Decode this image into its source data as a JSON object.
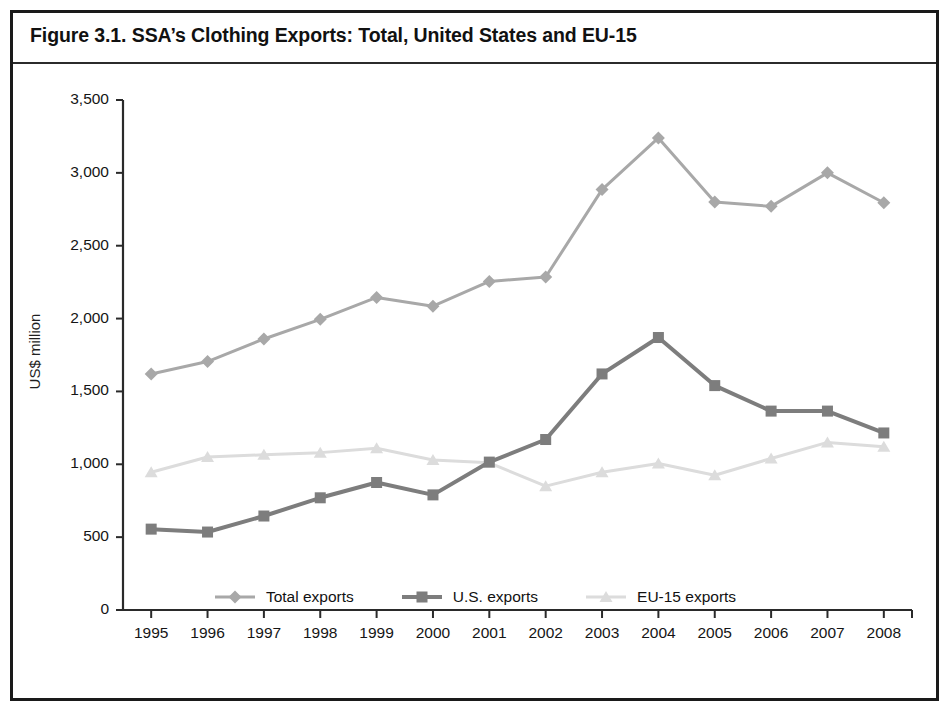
{
  "figure": {
    "title": "Figure 3.1. SSA’s Clothing Exports: Total, United States and EU-15"
  },
  "chart_data": {
    "type": "line",
    "title": "Figure 3.1. SSA’s Clothing Exports: Total, United States and EU-15",
    "xlabel": "",
    "ylabel": "US$ million",
    "categories": [
      "1995",
      "1996",
      "1997",
      "1998",
      "1999",
      "2000",
      "2001",
      "2002",
      "2003",
      "2004",
      "2005",
      "2006",
      "2007",
      "2008"
    ],
    "x": [
      1995,
      1996,
      1997,
      1998,
      1999,
      2000,
      2001,
      2002,
      2003,
      2004,
      2005,
      2006,
      2007,
      2008
    ],
    "ylim": [
      0,
      3500
    ],
    "ytick_labels": [
      "0",
      "500",
      "1,000",
      "1,500",
      "2,000",
      "2,500",
      "3,000",
      "3,500"
    ],
    "yticks": [
      0,
      500,
      1000,
      1500,
      2000,
      2500,
      3000,
      3500
    ],
    "grid": false,
    "legend_position": "bottom",
    "series": [
      {
        "name": "Total exports",
        "color": "#a8a8a8",
        "marker": "diamond",
        "values": [
          1620,
          1705,
          1860,
          1995,
          2145,
          2085,
          2255,
          2285,
          2885,
          3240,
          2800,
          2770,
          3000,
          2795
        ]
      },
      {
        "name": "U.S. exports",
        "color": "#7d7d7d",
        "marker": "square",
        "values": [
          555,
          535,
          645,
          770,
          875,
          790,
          1015,
          1170,
          1620,
          1870,
          1540,
          1365,
          1365,
          1215
        ]
      },
      {
        "name": "EU-15 exports",
        "color": "#dcdcdc",
        "marker": "triangle",
        "values": [
          945,
          1050,
          1065,
          1080,
          1110,
          1030,
          1010,
          850,
          945,
          1005,
          925,
          1040,
          1150,
          1120
        ]
      }
    ]
  },
  "legend": {
    "items": [
      {
        "label": "Total exports"
      },
      {
        "label": "U.S. exports"
      },
      {
        "label": "EU-15 exports"
      }
    ]
  }
}
